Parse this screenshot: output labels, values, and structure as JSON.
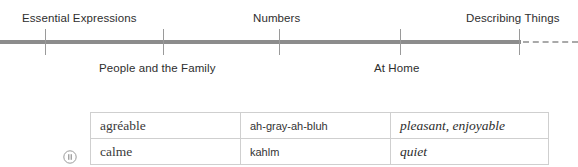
{
  "timeline": {
    "axis": {
      "solid_end_x": 521,
      "dashed_to_x": 578,
      "color": "#8c8c8c",
      "dash_color": "#a9a9a9"
    },
    "ticks": [
      45,
      163,
      279,
      400,
      519
    ],
    "labels": [
      {
        "text": "Essential Expressions",
        "position": "above",
        "x": 22
      },
      {
        "text": "People and the Family",
        "position": "below",
        "x": 99
      },
      {
        "text": "Numbers",
        "position": "above",
        "x": 253
      },
      {
        "text": "At Home",
        "position": "below",
        "x": 374
      },
      {
        "text": "Describing Things",
        "position": "above",
        "x": 466
      }
    ]
  },
  "vocab_table": {
    "rows": [
      {
        "term": "agréable",
        "phonetic": "ah-gray-ah-bluh",
        "meaning": "pleasant, enjoyable"
      },
      {
        "term": "calme",
        "phonetic": "kahlm",
        "meaning": "quiet"
      }
    ]
  },
  "audio": {
    "icon": "pause-circle-icon",
    "color": "#9b9b9b"
  }
}
